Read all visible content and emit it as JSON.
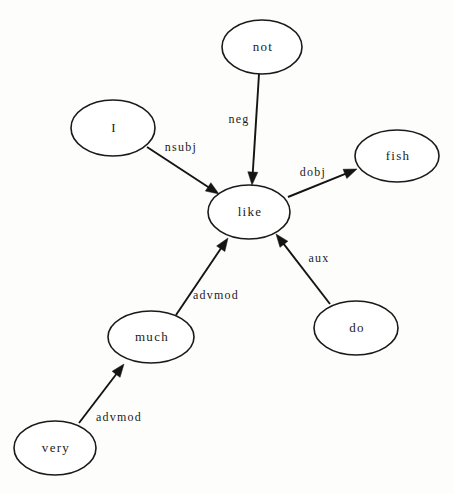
{
  "diagram": {
    "kind": "dependency-parse-graph",
    "sentence": "I do not like fish very much",
    "canvas": {
      "width": 454,
      "height": 493
    },
    "colors": {
      "background": "#fdfdfc",
      "node_fill": "#ffffff",
      "stroke": "#141414",
      "text": "#1c1c1c"
    }
  },
  "nodes": [
    {
      "id": "not",
      "label": "not",
      "cx": 262,
      "cy": 47,
      "rx": 40,
      "ry": 27
    },
    {
      "id": "i",
      "label": "I",
      "cx": 113,
      "cy": 128,
      "rx": 42,
      "ry": 28
    },
    {
      "id": "fish",
      "label": "fish",
      "cx": 397,
      "cy": 156,
      "rx": 42,
      "ry": 26
    },
    {
      "id": "like",
      "label": "like",
      "cx": 249,
      "cy": 212,
      "rx": 41,
      "ry": 27
    },
    {
      "id": "do",
      "label": "do",
      "cx": 356,
      "cy": 328,
      "rx": 42,
      "ry": 27
    },
    {
      "id": "much",
      "label": "much",
      "cx": 151,
      "cy": 337,
      "rx": 43,
      "ry": 26
    },
    {
      "id": "very",
      "label": "very",
      "cx": 55,
      "cy": 448,
      "rx": 41,
      "ry": 27
    }
  ],
  "edges": [
    {
      "id": "nsubj",
      "label": "nsubj",
      "from": "i",
      "to": "like",
      "x1": 147,
      "y1": 147,
      "x2": 219,
      "y2": 194,
      "label_x": 181,
      "label_y": 148
    },
    {
      "id": "neg",
      "label": "neg",
      "from": "not",
      "to": "like",
      "x1": 259,
      "y1": 74,
      "x2": 252,
      "y2": 185,
      "label_x": 239,
      "label_y": 120
    },
    {
      "id": "dobj",
      "label": "dobj",
      "from": "like",
      "to": "fish",
      "x1": 288,
      "y1": 197,
      "x2": 357,
      "y2": 169,
      "label_x": 313,
      "label_y": 173
    },
    {
      "id": "aux",
      "label": "aux",
      "from": "do",
      "to": "like",
      "x1": 330,
      "y1": 304,
      "x2": 276,
      "y2": 234,
      "label_x": 319,
      "label_y": 259
    },
    {
      "id": "advmod-much-like",
      "label": "advmod",
      "from": "much",
      "to": "like",
      "x1": 176,
      "y1": 315,
      "x2": 228,
      "y2": 238,
      "label_x": 216,
      "label_y": 296
    },
    {
      "id": "advmod-very-much",
      "label": "advmod",
      "from": "very",
      "to": "much",
      "x1": 79,
      "y1": 423,
      "x2": 124,
      "y2": 364,
      "label_x": 119,
      "label_y": 418
    }
  ]
}
